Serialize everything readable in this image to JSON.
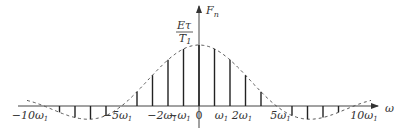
{
  "chart_data": {
    "type": "stem",
    "title": "",
    "xlabel": "ω",
    "ylabel": "F_n",
    "peak_label": {
      "numerator": "Eτ",
      "denominator": "T1"
    },
    "zero_crossing_harmonic": 5,
    "harmonics": [
      -9,
      -8,
      -7,
      -6,
      -4,
      -3,
      -2,
      -1,
      0,
      1,
      2,
      3,
      4,
      6,
      7,
      8,
      9
    ],
    "x_ticks": [
      {
        "n": -10,
        "label": "−10ω1"
      },
      {
        "n": -5,
        "label": "−5ω1"
      },
      {
        "n": -2,
        "label": "−2ω1"
      },
      {
        "n": -1,
        "label": "−ω1"
      },
      {
        "n": 0,
        "label": "0"
      },
      {
        "n": 1,
        "label": "ω1"
      },
      {
        "n": 2,
        "label": "2ω1"
      },
      {
        "n": 5,
        "label": "5ω1"
      },
      {
        "n": 10,
        "label": "10ω1"
      }
    ],
    "envelope": "sinc(n·π/5)",
    "xlim": [
      -11.7,
      11.7
    ],
    "ylim": [
      -0.25,
      1.3
    ]
  }
}
